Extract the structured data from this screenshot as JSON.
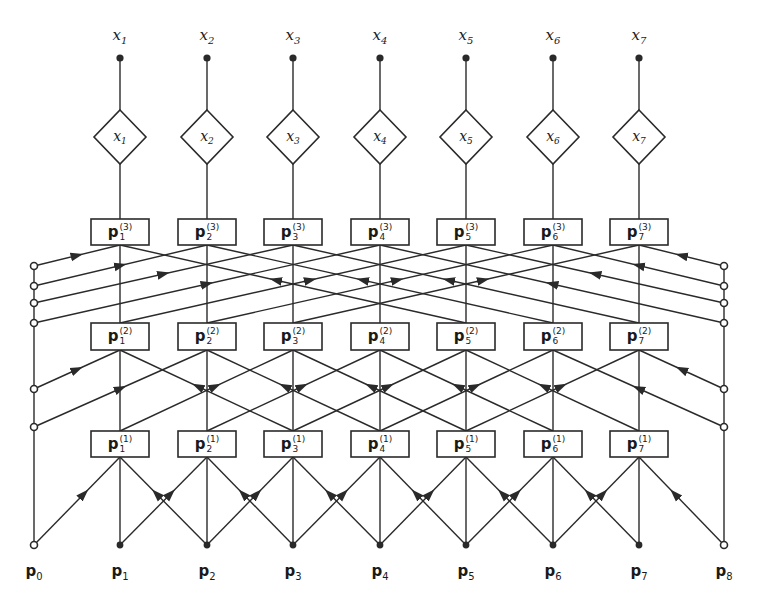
{
  "diagram": {
    "type": "layered-network",
    "stroke_color": "#2a2a2a",
    "columns": [
      120,
      207,
      293,
      380,
      466,
      553,
      639
    ],
    "left_boundary_x": 34,
    "right_boundary_x": 724,
    "outputs": [
      {
        "label": "x",
        "sub": "1"
      },
      {
        "label": "x",
        "sub": "2"
      },
      {
        "label": "x",
        "sub": "3"
      },
      {
        "label": "x",
        "sub": "4"
      },
      {
        "label": "x",
        "sub": "5"
      },
      {
        "label": "x",
        "sub": "6"
      },
      {
        "label": "x",
        "sub": "7"
      }
    ],
    "diamonds": [
      {
        "label": "x",
        "sub": "1"
      },
      {
        "label": "x",
        "sub": "2"
      },
      {
        "label": "x",
        "sub": "3"
      },
      {
        "label": "x",
        "sub": "4"
      },
      {
        "label": "x",
        "sub": "5"
      },
      {
        "label": "x",
        "sub": "6"
      },
      {
        "label": "x",
        "sub": "7"
      }
    ],
    "layers": [
      {
        "name": "layer-3",
        "sup": "(3)",
        "stride": 4,
        "box_top": 219,
        "box_bottom": 245,
        "boxes": [
          {
            "label": "p",
            "sub": "1"
          },
          {
            "label": "p",
            "sub": "2"
          },
          {
            "label": "p",
            "sub": "3"
          },
          {
            "label": "p",
            "sub": "4"
          },
          {
            "label": "p",
            "sub": "5"
          },
          {
            "label": "p",
            "sub": "6"
          },
          {
            "label": "p",
            "sub": "7"
          }
        ],
        "boundary_circles_y": [
          266,
          286,
          303,
          323
        ]
      },
      {
        "name": "layer-2",
        "sup": "(2)",
        "stride": 2,
        "box_top": 323,
        "box_bottom": 350,
        "boxes": [
          {
            "label": "p",
            "sub": "1"
          },
          {
            "label": "p",
            "sub": "2"
          },
          {
            "label": "p",
            "sub": "3"
          },
          {
            "label": "p",
            "sub": "4"
          },
          {
            "label": "p",
            "sub": "5"
          },
          {
            "label": "p",
            "sub": "6"
          },
          {
            "label": "p",
            "sub": "7"
          }
        ],
        "boundary_circles_y": [
          389,
          427
        ]
      },
      {
        "name": "layer-1",
        "sup": "(1)",
        "stride": 1,
        "box_top": 431,
        "box_bottom": 457,
        "boxes": [
          {
            "label": "p",
            "sub": "1"
          },
          {
            "label": "p",
            "sub": "2"
          },
          {
            "label": "p",
            "sub": "3"
          },
          {
            "label": "p",
            "sub": "4"
          },
          {
            "label": "p",
            "sub": "5"
          },
          {
            "label": "p",
            "sub": "6"
          },
          {
            "label": "p",
            "sub": "7"
          }
        ],
        "boundary_circles_y": [
          545
        ]
      }
    ],
    "inputs": [
      {
        "label": "p",
        "sub": "0",
        "open": true
      },
      {
        "label": "p",
        "sub": "1",
        "open": false
      },
      {
        "label": "p",
        "sub": "2",
        "open": false
      },
      {
        "label": "p",
        "sub": "3",
        "open": false
      },
      {
        "label": "p",
        "sub": "4",
        "open": false
      },
      {
        "label": "p",
        "sub": "5",
        "open": false
      },
      {
        "label": "p",
        "sub": "6",
        "open": false
      },
      {
        "label": "p",
        "sub": "7",
        "open": false
      },
      {
        "label": "p",
        "sub": "8",
        "open": true
      }
    ]
  }
}
